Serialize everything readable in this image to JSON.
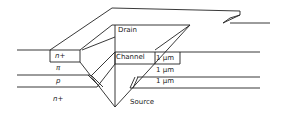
{
  "diagram": {
    "type": "V-groove transistor cross-section",
    "labels": {
      "drain": "Drain",
      "channel": "Channel",
      "source": "Source",
      "layer_n_plus_top": "n+",
      "layer_pi": "π",
      "layer_p": "p",
      "layer_n_plus_bottom": "n+",
      "thickness_1": "1 μm",
      "thickness_2": "1 μm",
      "thickness_3": "1 μm"
    },
    "colors": {
      "line": "#222222",
      "background": "#ffffff"
    }
  }
}
